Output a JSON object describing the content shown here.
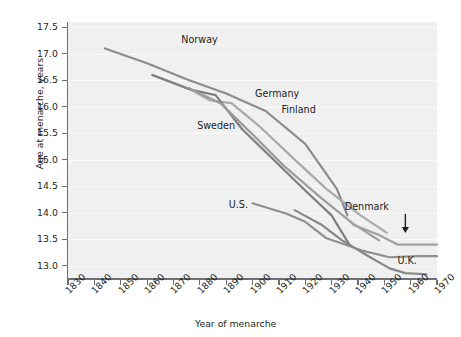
{
  "chart_data": {
    "type": "line",
    "title": "",
    "xlabel": "Year of menarche",
    "ylabel": "Age at menarche, years",
    "xlim": [
      1830,
      1970
    ],
    "ylim": [
      12.75,
      17.6
    ],
    "xticks": [
      1830,
      1840,
      1850,
      1860,
      1870,
      1880,
      1890,
      1900,
      1910,
      1920,
      1930,
      1940,
      1950,
      1960,
      1970
    ],
    "yticks": [
      "17.5",
      "17.0",
      "16.5",
      "16.0",
      "15.5",
      "15.0",
      "14.5",
      "14.0",
      "13.5",
      "13.0"
    ],
    "grid": "horizontal",
    "legend": "inline-labels",
    "series": [
      {
        "name": "Norway",
        "color": "#8c8c8c",
        "label_x": 1873,
        "label_y": 17.25,
        "points": [
          [
            1844,
            17.1
          ],
          [
            1860,
            16.82
          ],
          [
            1875,
            16.52
          ],
          [
            1890,
            16.25
          ],
          [
            1905,
            15.92
          ],
          [
            1920,
            15.3
          ],
          [
            1932,
            14.45
          ],
          [
            1936,
            13.95
          ]
        ]
      },
      {
        "name": "Sweden",
        "color": "#a9a9a9",
        "label_x": 1879,
        "label_y": 15.62,
        "points": [
          [
            1862,
            16.6
          ],
          [
            1876,
            16.34
          ],
          [
            1884,
            16.12
          ],
          [
            1892,
            16.07
          ],
          [
            1902,
            15.66
          ],
          [
            1915,
            15.05
          ],
          [
            1928,
            14.45
          ],
          [
            1941,
            13.95
          ],
          [
            1951,
            13.62
          ]
        ]
      },
      {
        "name": "Germany",
        "color": "#7e7e7e",
        "label_x": 1901,
        "label_y": 16.22,
        "points": [
          [
            1862,
            16.6
          ],
          [
            1876,
            16.33
          ],
          [
            1886,
            16.22
          ],
          [
            1896,
            15.58
          ],
          [
            1908,
            15.0
          ],
          [
            1920,
            14.42
          ],
          [
            1930,
            13.95
          ],
          [
            1937,
            13.38
          ]
        ]
      },
      {
        "name": "Finland",
        "color": "#9c9c9c",
        "label_x": 1911,
        "label_y": 15.92,
        "points": [
          [
            1876,
            16.35
          ],
          [
            1888,
            16.06
          ],
          [
            1900,
            15.48
          ],
          [
            1912,
            14.88
          ],
          [
            1926,
            14.28
          ],
          [
            1938,
            13.8
          ],
          [
            1948,
            13.48
          ]
        ]
      },
      {
        "name": "U.S.",
        "color": "#8f8f8f",
        "label_x": 1891,
        "label_y": 14.12,
        "points": [
          [
            1900,
            14.18
          ],
          [
            1913,
            13.98
          ],
          [
            1920,
            13.83
          ],
          [
            1928,
            13.52
          ],
          [
            1934,
            13.42
          ],
          [
            1942,
            13.28
          ],
          [
            1952,
            13.16
          ],
          [
            1963,
            13.18
          ],
          [
            1970,
            13.18
          ]
        ]
      },
      {
        "name": "Denmark",
        "color": "#a2a2a2",
        "label_x": 1935,
        "label_y": 14.1,
        "points": [
          [
            1938,
            13.78
          ],
          [
            1948,
            13.58
          ],
          [
            1955,
            13.4
          ],
          [
            1962,
            13.4
          ],
          [
            1970,
            13.4
          ]
        ]
      },
      {
        "name": "U.K.",
        "color": "#878787",
        "label_x": 1955,
        "label_y": 13.08,
        "points": [
          [
            1916,
            14.05
          ],
          [
            1926,
            13.78
          ],
          [
            1934,
            13.48
          ],
          [
            1944,
            13.18
          ],
          [
            1952,
            12.95
          ],
          [
            1958,
            12.86
          ],
          [
            1966,
            12.84
          ]
        ]
      }
    ],
    "annotations": [
      {
        "name": "denmark-arrow",
        "type": "arrow",
        "x": 1958,
        "y_top": 13.98,
        "y_bottom": 13.62
      }
    ]
  }
}
